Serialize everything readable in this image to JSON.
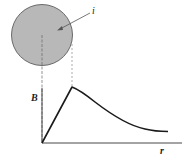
{
  "diagram": {
    "title": "",
    "wire": {
      "label": "i",
      "fill": "#b8b8b8",
      "stroke": "#6a6a6a"
    },
    "axes": {
      "y_label": "B",
      "x_label": "r"
    },
    "curve": {
      "description": "B rises linearly inside the wire to a peak at the wire surface, then decays as 1/r outside",
      "stroke": "#1a1a1a"
    }
  }
}
